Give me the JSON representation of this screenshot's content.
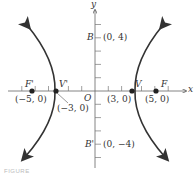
{
  "diagram": {
    "type": "hyperbola",
    "axes": {
      "x_label": "x",
      "y_label": "y",
      "origin_label": "O"
    },
    "vertices": [
      {
        "name": "V'",
        "coords": "(−3, 0)"
      },
      {
        "name": "V",
        "coords": "(3, 0)"
      }
    ],
    "foci": [
      {
        "name": "F'",
        "coords": "(−5, 0)"
      },
      {
        "name": "F",
        "coords": "(5, 0)"
      }
    ],
    "co_vertices": [
      {
        "name": "B",
        "coords": "(0, 4)"
      },
      {
        "name": "B'",
        "coords": "(0, −4)"
      }
    ],
    "caption": "FIGURE"
  }
}
